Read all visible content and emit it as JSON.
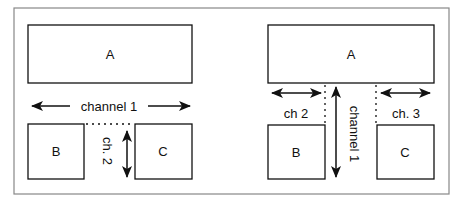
{
  "left_panel": {
    "box_a": "A",
    "box_b": "B",
    "box_c": "C",
    "channel_1": "channel 1",
    "channel_2": "ch. 2"
  },
  "right_panel": {
    "box_a": "A",
    "box_b": "B",
    "box_c": "C",
    "channel_1": "channel 1",
    "channel_2": "ch 2",
    "channel_3": "ch. 3"
  },
  "colors": {
    "frame": "#888888",
    "stroke": "#111111",
    "background": "#ffffff"
  }
}
